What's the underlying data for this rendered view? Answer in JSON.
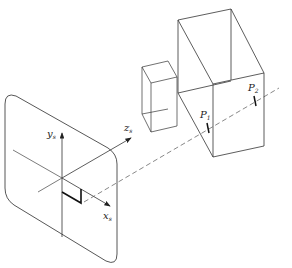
{
  "figure": {
    "type": "perspective projection diagram",
    "labels": {
      "y_axis": "y",
      "y_axis_sub": "s",
      "z_axis": "z",
      "z_axis_sub": "s",
      "x_axis": "x",
      "x_axis_sub": "s",
      "p1": "P",
      "p1_sub": "1",
      "p2": "P",
      "p2_sub": "2"
    },
    "colors": {
      "stroke": "#333333",
      "background": "#ffffff"
    }
  }
}
